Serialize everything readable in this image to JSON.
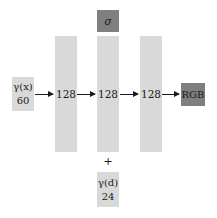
{
  "diagram": {
    "input_x": {
      "label": "γ(x)",
      "dim": "60"
    },
    "layers": [
      {
        "units": "128"
      },
      {
        "units": "128"
      },
      {
        "units": "128"
      }
    ],
    "sigma_output": {
      "label": "σ"
    },
    "rgb_output": {
      "label": "RGB"
    },
    "concat_symbol": "+",
    "input_d": {
      "label": "γ(d)",
      "dim": "24"
    },
    "colors": {
      "layer_fill": "#d9d9d9",
      "output_fill": "#7f7f7f",
      "arrow": "#1a1a1a"
    }
  }
}
